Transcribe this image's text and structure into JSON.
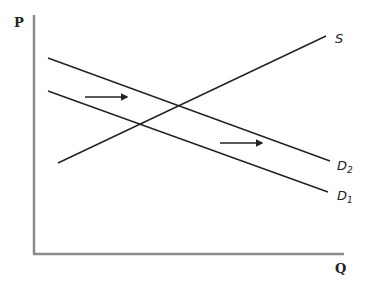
{
  "diagram": {
    "type": "supply-demand",
    "axes": {
      "y_label": "P",
      "x_label": "Q"
    },
    "curves": [
      {
        "id": "S",
        "label": "S",
        "subscript": ""
      },
      {
        "id": "D2",
        "label": "D",
        "subscript": "2"
      },
      {
        "id": "D1",
        "label": "D",
        "subscript": "1"
      }
    ],
    "annotations": [
      {
        "type": "arrow",
        "meaning": "demand shift right",
        "from": [
          85,
          97
        ],
        "to": [
          128,
          97
        ]
      },
      {
        "type": "arrow",
        "meaning": "demand shift right",
        "from": [
          220,
          143
        ],
        "to": [
          263,
          143
        ]
      }
    ],
    "colors": {
      "axis": "#8a8a8a",
      "line": "#222222"
    }
  }
}
